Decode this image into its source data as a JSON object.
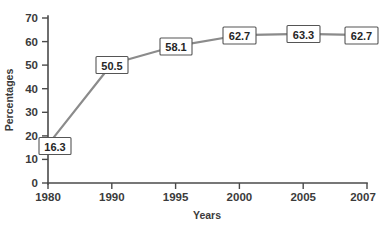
{
  "chart_data": {
    "type": "line",
    "title": "",
    "subtitle": "",
    "xlabel": "Years",
    "ylabel": "Percentages",
    "categories": [
      "1980",
      "1990",
      "1995",
      "2000",
      "2005",
      "2007"
    ],
    "values": [
      16.3,
      50.5,
      58.1,
      62.7,
      63.3,
      62.7
    ],
    "point_labels": [
      "16.3",
      "50.5",
      "58.1",
      "62.7",
      "63.3",
      "62.7"
    ],
    "series": [
      {
        "name": "Percentages",
        "values": [
          16.3,
          50.5,
          58.1,
          62.7,
          63.3,
          62.7
        ]
      }
    ],
    "ylim": [
      0,
      70
    ],
    "ytick_values": [
      0,
      10,
      20,
      30,
      40,
      50,
      60,
      70
    ],
    "ytick_labels": [
      "0",
      "10",
      "20",
      "30",
      "40",
      "50",
      "60",
      "70"
    ],
    "xtick_labels": [
      "1980",
      "1990",
      "1995",
      "2000",
      "2005",
      "2007"
    ],
    "grid": false,
    "legend": false,
    "legend_position": "none",
    "line_color": "#8b8b8b",
    "axis_color": "#4a4a4a",
    "label_box_fill": "#ffffff",
    "label_box_border": "#555555",
    "background_color": "#ffffff",
    "x_scale": "categorical"
  }
}
